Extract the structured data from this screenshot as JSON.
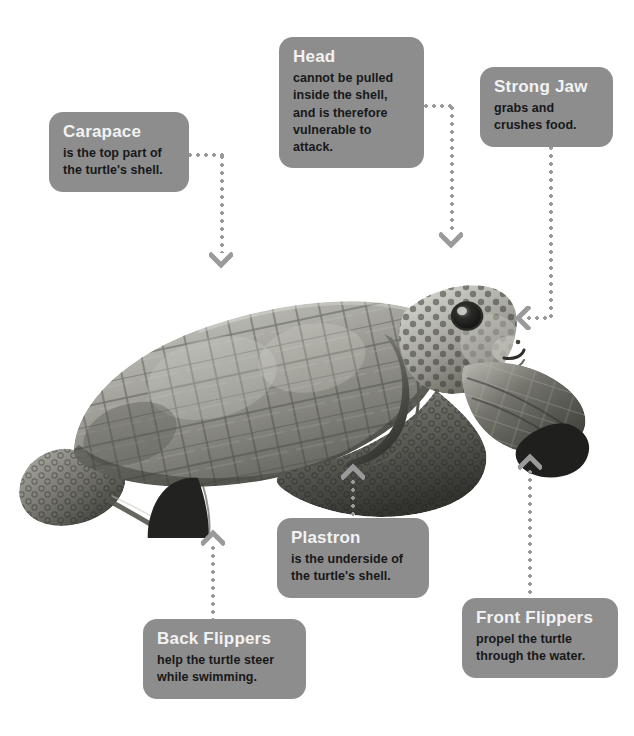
{
  "page": {
    "background_color": "#ffffff",
    "callout_color": "#8d8d8d",
    "title_color": "#f2f2f2",
    "body_color": "#17181a",
    "connector_color": "#9a9a9a"
  },
  "image": {
    "alt": "Green sea turtle, side view facing right",
    "name": "sea-turtle-photo"
  },
  "callouts": [
    {
      "id": "carapace",
      "title": "Carapace",
      "body": "is the top part of\nthe turtle's shell.",
      "arrow_direction": "down"
    },
    {
      "id": "head",
      "title": "Head",
      "body": "cannot be pulled\ninside the shell,\nand is therefore\nvulnerable to\nattack.",
      "arrow_direction": "down"
    },
    {
      "id": "strong-jaw",
      "title": "Strong Jaw",
      "body": "grabs and\ncrushes food.",
      "arrow_direction": "left"
    },
    {
      "id": "plastron",
      "title": "Plastron",
      "body": "is the underside of\nthe turtle's shell.",
      "arrow_direction": "up"
    },
    {
      "id": "back-flippers",
      "title": "Back Flippers",
      "body": "help the turtle steer\nwhile swimming.",
      "arrow_direction": "up"
    },
    {
      "id": "front-flippers",
      "title": "Front Flippers",
      "body": "propel the turtle\nthrough the water.",
      "arrow_direction": "up"
    }
  ]
}
